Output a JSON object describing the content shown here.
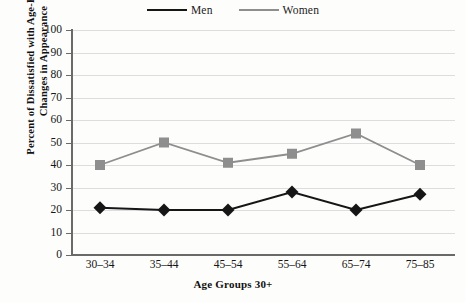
{
  "chart_data": {
    "type": "line",
    "title": "",
    "categories": [
      "30–34",
      "35–44",
      "45–54",
      "55–64",
      "65–74",
      "75–85"
    ],
    "series": [
      {
        "name": "Men",
        "values": [
          21,
          20,
          20,
          28,
          20,
          27
        ],
        "color": "#161616",
        "marker": "diamond"
      },
      {
        "name": "Women",
        "values": [
          40,
          50,
          41,
          45,
          54,
          40
        ],
        "color": "#8e8e8e",
        "marker": "square"
      }
    ],
    "xlabel": "Age Groups 30+",
    "ylabel_line1": "Percent of Dissatisfied with Age-Related",
    "ylabel_line2": "Changes in Appearance",
    "ylim": [
      0,
      100
    ],
    "ytick_step": 10,
    "yticks": [
      "100",
      "90",
      "80",
      "70",
      "60",
      "50",
      "40",
      "30",
      "20",
      "10",
      "0"
    ],
    "grid": true,
    "legend_position": "top-center",
    "background_color": "#fdfdfb",
    "grid_color": "#dddddd",
    "axis_color": "#6a6a6a"
  },
  "legend": {
    "items": [
      {
        "label": "Men"
      },
      {
        "label": "Women"
      }
    ]
  }
}
